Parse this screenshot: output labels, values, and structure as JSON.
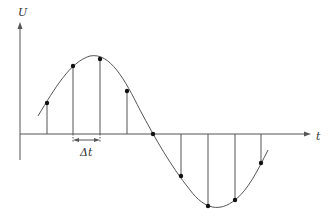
{
  "axes": {
    "y_label": "U",
    "x_label": "t",
    "interval_label": "Δt"
  },
  "colors": {
    "stroke": "#555555",
    "points": "#111111",
    "background": "#ffffff"
  },
  "sample_points": [
    {
      "x": 47,
      "y": 103
    },
    {
      "x": 73,
      "y": 66
    },
    {
      "x": 100,
      "y": 59
    },
    {
      "x": 127,
      "y": 91
    },
    {
      "x": 153,
      "y": 134
    },
    {
      "x": 181,
      "y": 176
    },
    {
      "x": 208,
      "y": 206
    },
    {
      "x": 235,
      "y": 200
    },
    {
      "x": 261,
      "y": 163
    }
  ]
}
